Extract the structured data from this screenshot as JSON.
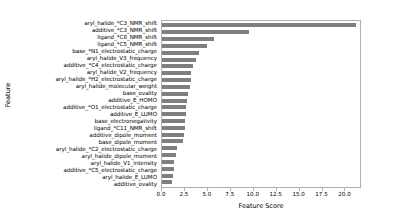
{
  "chart_data": {
    "type": "bar",
    "orientation": "horizontal",
    "title": "",
    "xlabel": "Feature Score",
    "ylabel": "Feature",
    "xlim": [
      0.0,
      21.8
    ],
    "ylim": null,
    "grid": false,
    "legend": null,
    "bar_color": "#7f7f7f",
    "xticks": [
      0.0,
      2.5,
      5.0,
      7.5,
      10.0,
      12.5,
      15.0,
      17.5,
      20.0
    ],
    "xticklabels": [
      "0.0",
      "2.5",
      "5.0",
      "7.5",
      "10.0",
      "12.5",
      "15.0",
      "17.5",
      "20.0"
    ],
    "categories": [
      "aryl_halide_*C3_NMR_shift",
      "additive_*C3_NMR_shift",
      "ligand_*C8_NMR_shift",
      "ligand_*C5_NMR_shift",
      "base_*N1_electrostatic_charge",
      "aryl_halide_V3_frequency",
      "additive_*C4_electrostatic_charge",
      "aryl_halide_V2_frequency",
      "aryl_halide_*H2_electrostatic_charge",
      "aryl_halide_molecular_weight",
      "base_ovality",
      "additive_E_HOMO",
      "additive_*O1_electrostatic_charge",
      "additive_E_LUMO",
      "base_electronegativity",
      "ligand_*C11_NMR_shift",
      "additive_dipole_moment",
      "base_dipole_moment",
      "aryl_halide_*C2_electrostatic_charge",
      "aryl_halide_dipole_moment",
      "aryl_halide_V1_intensity",
      "additive_*C5_electrostatic_charge",
      "aryl_halide_E_LUMO",
      "additive_ovality"
    ],
    "values": [
      21.4,
      9.6,
      5.7,
      5.0,
      4.1,
      3.7,
      3.4,
      3.2,
      3.2,
      3.1,
      2.9,
      2.7,
      2.6,
      2.6,
      2.5,
      2.5,
      2.4,
      2.3,
      1.6,
      1.5,
      1.3,
      1.3,
      1.2,
      1.1
    ]
  }
}
